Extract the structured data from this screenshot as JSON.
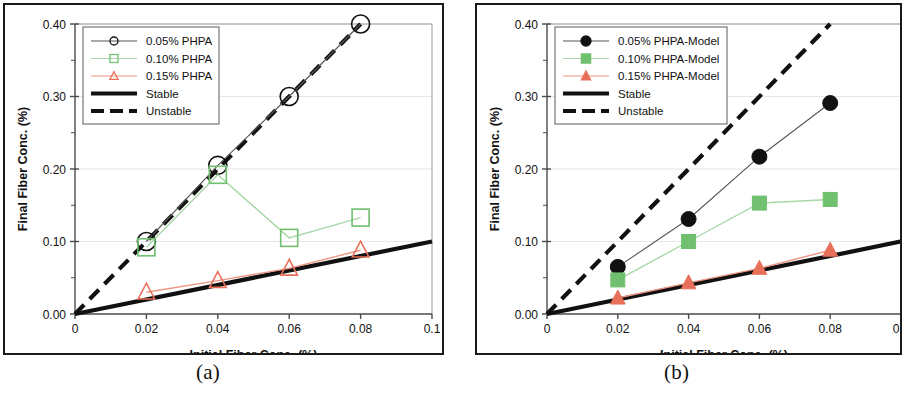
{
  "figure": {
    "panels": [
      {
        "caption": "(a)",
        "id": "a"
      },
      {
        "caption": "(b)",
        "id": "b"
      }
    ]
  },
  "colors": {
    "black": "#111111",
    "green": "#70C070",
    "green_line": "#A8D8A8",
    "red": "#E8705A",
    "red_line": "#EE9480",
    "axis": "#4a4a4a",
    "grid": "#e6e6e6",
    "border": "#1a1a1a"
  },
  "chart_data": [
    {
      "type": "line",
      "panel": "(a)",
      "title": "",
      "xlabel": "Initial Fiber Conc. (%)",
      "ylabel": "Final Fiber Conc.  (%)",
      "xlim": [
        0,
        0.1
      ],
      "ylim": [
        0.0,
        0.4
      ],
      "xticks": [
        0,
        0.02,
        0.04,
        0.06,
        0.08,
        0.1
      ],
      "xtick_labels": [
        "0",
        "0.02",
        "0.04",
        "0.06",
        "0.08",
        "0.1"
      ],
      "yticks": [
        0.0,
        0.1,
        0.2,
        0.3,
        0.4
      ],
      "ytick_labels": [
        "0.00",
        "0.10",
        "0.20",
        "0.30",
        "0.40"
      ],
      "minor_yticks": [
        0.05,
        0.15,
        0.25,
        0.35
      ],
      "grid": "horizontal-major-light",
      "legend_position": "top-left",
      "x": [
        0.02,
        0.04,
        0.06,
        0.08
      ],
      "series": [
        {
          "name": "0.05% PHPA",
          "marker": "open-circle",
          "color": "#111111",
          "values": [
            0.1,
            0.205,
            0.3,
            0.4
          ]
        },
        {
          "name": "0.10% PHPA",
          "marker": "open-square",
          "color": "#70C070",
          "values": [
            0.092,
            0.192,
            0.105,
            0.133
          ]
        },
        {
          "name": "0.15% PHPA",
          "marker": "open-triangle",
          "color": "#E8705A",
          "values": [
            0.03,
            0.046,
            0.063,
            0.088
          ]
        }
      ],
      "reference_lines": [
        {
          "name": "Stable",
          "style": "solid",
          "color": "#111111",
          "slope": 1.0,
          "from": [
            0,
            0.0
          ],
          "to": [
            0.1,
            0.1
          ]
        },
        {
          "name": "Unstable",
          "style": "dashed",
          "color": "#111111",
          "slope": 5.0,
          "from": [
            0,
            0.0
          ],
          "to": [
            0.08,
            0.4
          ]
        }
      ],
      "legend": [
        "0.05% PHPA",
        "0.10% PHPA",
        "0.15% PHPA",
        "Stable",
        "Unstable"
      ]
    },
    {
      "type": "line",
      "panel": "(b)",
      "title": "",
      "xlabel": "Initial Fiber Conc. (%)",
      "ylabel": "Final Fiber Conc.  (%)",
      "xlim": [
        0,
        0.1
      ],
      "ylim": [
        0.0,
        0.4
      ],
      "xticks": [
        0,
        0.02,
        0.04,
        0.06,
        0.08,
        0.1
      ],
      "xtick_labels": [
        "0",
        "0.02",
        "0.04",
        "0.06",
        "0.08",
        "0.1"
      ],
      "yticks": [
        0.0,
        0.1,
        0.2,
        0.3,
        0.4
      ],
      "ytick_labels": [
        "0.00",
        "0.10",
        "0.20",
        "0.30",
        "0.40"
      ],
      "minor_yticks": [
        0.05,
        0.15,
        0.25,
        0.35
      ],
      "grid": "horizontal-major-light",
      "legend_position": "top-left",
      "x": [
        0.02,
        0.04,
        0.06,
        0.08
      ],
      "series": [
        {
          "name": "0.05% PHPA-Model",
          "marker": "filled-circle",
          "color": "#111111",
          "values": [
            0.065,
            0.131,
            0.217,
            0.291
          ]
        },
        {
          "name": "0.10% PHPA-Model",
          "marker": "filled-square",
          "color": "#70C070",
          "values": [
            0.047,
            0.1,
            0.153,
            0.158
          ]
        },
        {
          "name": "0.15% PHPA-Model",
          "marker": "filled-triangle",
          "color": "#E8705A",
          "values": [
            0.022,
            0.043,
            0.063,
            0.088
          ]
        }
      ],
      "reference_lines": [
        {
          "name": "Stable",
          "style": "solid",
          "color": "#111111",
          "slope": 1.0,
          "from": [
            0,
            0.0
          ],
          "to": [
            0.1,
            0.1
          ]
        },
        {
          "name": "Unstable",
          "style": "dashed",
          "color": "#111111",
          "slope": 5.0,
          "from": [
            0,
            0.0
          ],
          "to": [
            0.08,
            0.4
          ]
        }
      ],
      "legend": [
        "0.05% PHPA-Model",
        "0.10% PHPA-Model",
        "0.15% PHPA-Model",
        "Stable",
        "Unstable"
      ]
    }
  ]
}
